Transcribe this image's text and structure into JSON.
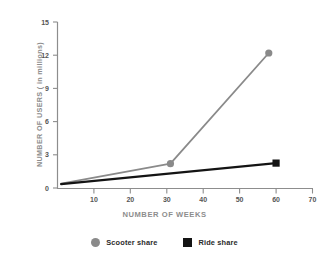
{
  "chart_data": {
    "type": "line",
    "title": "",
    "xlabel": "NUMBER OF WEEKS",
    "ylabel": "NUMBER OF USERS ( in millions)",
    "xlim": [
      0,
      70
    ],
    "ylim": [
      0,
      15
    ],
    "xticks": [
      10,
      20,
      30,
      40,
      50,
      60,
      70
    ],
    "yticks": [
      0,
      3,
      6,
      9,
      12,
      15
    ],
    "grid": false,
    "legend_position": "bottom",
    "series": [
      {
        "name": "Scooter share",
        "color": "#8a8a8a",
        "marker": "circle",
        "points": [
          {
            "x": 1,
            "y": 0.4
          },
          {
            "x": 31,
            "y": 2.2
          },
          {
            "x": 58,
            "y": 12.2
          }
        ]
      },
      {
        "name": "Ride share",
        "color": "#141414",
        "marker": "square",
        "points": [
          {
            "x": 1,
            "y": 0.35
          },
          {
            "x": 60,
            "y": 2.25
          }
        ]
      }
    ]
  },
  "axes": {
    "y_title": "NUMBER OF USERS ( in millions)",
    "x_title": "NUMBER OF WEEKS",
    "y_tick_labels": [
      "15",
      "12",
      "9",
      "6",
      "3",
      "0"
    ],
    "x_tick_labels": [
      "10",
      "20",
      "30",
      "40",
      "50",
      "60",
      "70"
    ],
    "axis_color": "#8d8d8d"
  },
  "legend": {
    "items": [
      {
        "label": "Scooter share",
        "marker": "circle-marker",
        "color": "#8a8a8a"
      },
      {
        "label": "Ride share",
        "marker": "square-marker",
        "color": "#141414"
      }
    ]
  }
}
